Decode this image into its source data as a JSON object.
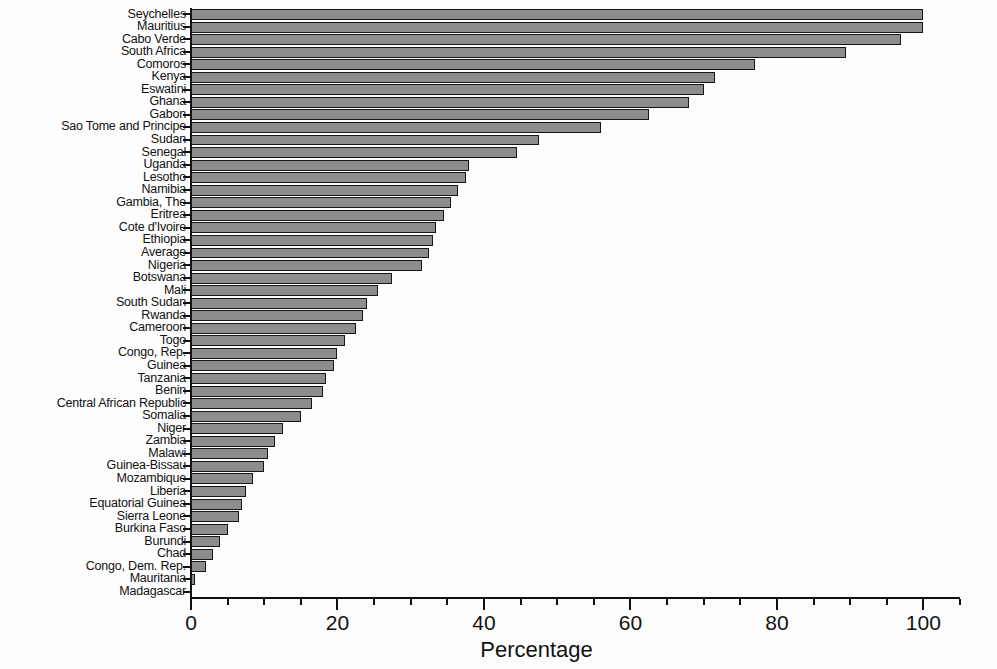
{
  "chart_data": {
    "type": "bar",
    "orientation": "horizontal",
    "title": "",
    "xlabel": "Percentage",
    "ylabel": "",
    "xlim": [
      0,
      105
    ],
    "xticks": [
      0,
      20,
      40,
      60,
      80,
      100
    ],
    "xtick_labels": [
      "0",
      "20",
      "40",
      "60",
      "80",
      "100"
    ],
    "minor_tick_step": 5,
    "grid": false,
    "legend": null,
    "bar_color": "#8d8d8d",
    "bar_edge_color": "#161616",
    "axis_color": "#111111",
    "background_color": "#ffffff",
    "categories": [
      "Seychelles",
      "Mauritius",
      "Cabo Verde",
      "South Africa",
      "Comoros",
      "Kenya",
      "Eswatini",
      "Ghana",
      "Gabon",
      "Sao Tome and Principe",
      "Sudan",
      "Senegal",
      "Uganda",
      "Lesotho",
      "Namibia",
      "Gambia, The",
      "Eritrea",
      "Cote d'Ivoire",
      "Ethiopia",
      "Average",
      "Nigeria",
      "Botswana",
      "Mali",
      "South Sudan",
      "Rwanda",
      "Cameroon",
      "Togo",
      "Congo, Rep.",
      "Guinea",
      "Tanzania",
      "Benin",
      "Central African Republic",
      "Somalia",
      "Niger",
      "Zambia",
      "Malawi",
      "Guinea-Bissau",
      "Mozambique",
      "Liberia",
      "Equatorial Guinea",
      "Sierra Leone",
      "Burkina Faso",
      "Burundi",
      "Chad",
      "Congo, Dem. Rep.",
      "Mauritania",
      "Madagascar"
    ],
    "values": [
      100.0,
      100.0,
      97.0,
      89.5,
      77.0,
      71.5,
      70.0,
      68.0,
      62.5,
      56.0,
      47.5,
      44.5,
      38.0,
      37.5,
      36.5,
      35.5,
      34.5,
      33.5,
      33.0,
      32.5,
      31.5,
      27.5,
      25.5,
      24.0,
      23.5,
      22.5,
      21.0,
      20.0,
      19.5,
      18.5,
      18.0,
      16.5,
      15.0,
      12.5,
      11.5,
      10.5,
      10.0,
      8.5,
      7.5,
      7.0,
      6.5,
      5.0,
      4.0,
      3.0,
      2.0,
      0.6,
      0.0
    ]
  }
}
